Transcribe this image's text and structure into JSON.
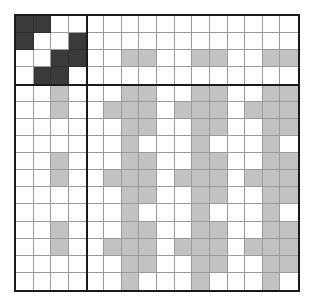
{
  "figure": {
    "caption": "",
    "rows": 16,
    "cols": 16,
    "block_split_index": 4
  },
  "colors": {
    "empty": "#ffffff",
    "gray": "#c2c2c2",
    "dark": "#3a3a3a",
    "gridline": "#9a9a9a",
    "frame": "#1a1a1a",
    "background": "#ffffff"
  },
  "legend": {
    "empty_label": "empty",
    "gray_label": "filled",
    "dark_label": "highlighted"
  },
  "chart_data": {
    "type": "heatmap",
    "xlabel": "",
    "ylabel": "",
    "grid": true,
    "legend_position": "none",
    "nrows": 16,
    "ncols": 16,
    "value_levels": [
      0,
      1,
      2
    ],
    "value_labels": [
      "empty",
      "gray",
      "dark"
    ],
    "blocks": {
      "top_left": {
        "rows": 4,
        "cols": 4,
        "fill": "dark"
      },
      "top_right": {
        "rows": 4,
        "cols": 12,
        "fill": "gray"
      },
      "bottom_left": {
        "rows": 12,
        "cols": 4,
        "fill": "gray"
      },
      "bottom_right": {
        "rows": 12,
        "cols": 12,
        "fill": "gray"
      }
    },
    "matrix": [
      [
        2,
        2,
        0,
        0,
        0,
        0,
        0,
        0,
        0,
        0,
        0,
        0,
        0,
        0,
        0,
        0
      ],
      [
        2,
        0,
        0,
        2,
        0,
        0,
        0,
        0,
        0,
        0,
        0,
        0,
        0,
        0,
        0,
        0
      ],
      [
        0,
        0,
        2,
        2,
        0,
        0,
        1,
        1,
        0,
        0,
        1,
        1,
        0,
        0,
        1,
        1
      ],
      [
        0,
        2,
        2,
        0,
        0,
        0,
        0,
        0,
        0,
        0,
        0,
        0,
        0,
        0,
        0,
        0
      ],
      [
        0,
        0,
        1,
        0,
        0,
        0,
        1,
        1,
        0,
        0,
        1,
        1,
        0,
        0,
        1,
        1
      ],
      [
        0,
        0,
        1,
        0,
        0,
        1,
        1,
        1,
        0,
        1,
        1,
        1,
        0,
        1,
        1,
        1
      ],
      [
        0,
        0,
        0,
        0,
        0,
        0,
        1,
        1,
        0,
        0,
        1,
        1,
        0,
        0,
        1,
        1
      ],
      [
        0,
        0,
        0,
        0,
        0,
        0,
        1,
        0,
        0,
        0,
        1,
        0,
        0,
        0,
        1,
        0
      ],
      [
        0,
        0,
        1,
        0,
        0,
        0,
        1,
        1,
        0,
        0,
        1,
        1,
        0,
        0,
        1,
        1
      ],
      [
        0,
        0,
        1,
        0,
        0,
        1,
        1,
        1,
        0,
        1,
        1,
        1,
        0,
        1,
        1,
        1
      ],
      [
        0,
        0,
        0,
        0,
        0,
        0,
        1,
        1,
        0,
        0,
        1,
        1,
        0,
        0,
        1,
        1
      ],
      [
        0,
        0,
        0,
        0,
        0,
        0,
        1,
        0,
        0,
        0,
        1,
        0,
        0,
        0,
        1,
        0
      ],
      [
        0,
        0,
        1,
        0,
        0,
        0,
        1,
        1,
        0,
        0,
        1,
        1,
        0,
        0,
        1,
        1
      ],
      [
        0,
        0,
        1,
        0,
        0,
        1,
        1,
        1,
        0,
        1,
        1,
        1,
        0,
        1,
        1,
        1
      ],
      [
        0,
        0,
        0,
        0,
        0,
        0,
        1,
        1,
        0,
        0,
        1,
        1,
        0,
        0,
        1,
        1
      ],
      [
        0,
        0,
        0,
        0,
        0,
        0,
        1,
        0,
        0,
        0,
        1,
        0,
        0,
        0,
        1,
        0
      ]
    ]
  }
}
